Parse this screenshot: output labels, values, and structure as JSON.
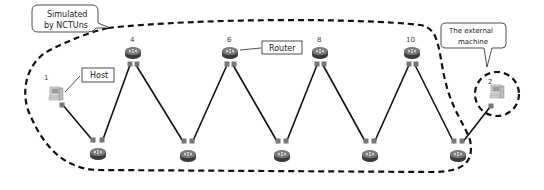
{
  "callouts": {
    "simulated": {
      "line1": "Simulated",
      "line2": "by NCTUns"
    },
    "external": {
      "line1": "The external",
      "line2": "machine"
    }
  },
  "labels": {
    "host": "Host",
    "router": "Router"
  },
  "nodes": {
    "host1": {
      "id": "1",
      "type": "host"
    },
    "host2": {
      "id": "2",
      "type": "host"
    },
    "router4": {
      "id": "4",
      "type": "router"
    },
    "router6": {
      "id": "6",
      "type": "router"
    },
    "router8": {
      "id": "8",
      "type": "router"
    },
    "router10": {
      "id": "10",
      "type": "router"
    }
  },
  "colors": {
    "line": "#111111",
    "dash": "#111111",
    "router": "#555555",
    "port": "#777777"
  }
}
